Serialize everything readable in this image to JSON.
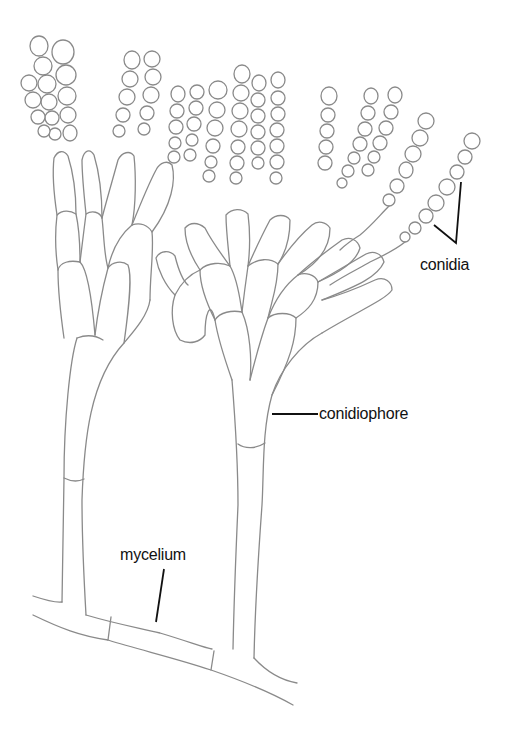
{
  "diagram": {
    "labels": {
      "conidia": "conidia",
      "conidiophore": "conidiophore",
      "mycelium": "mycelium"
    },
    "colors": {
      "outline": "#8a8a8a",
      "leader_line": "#111111",
      "text": "#111111",
      "background": "#ffffff"
    }
  }
}
